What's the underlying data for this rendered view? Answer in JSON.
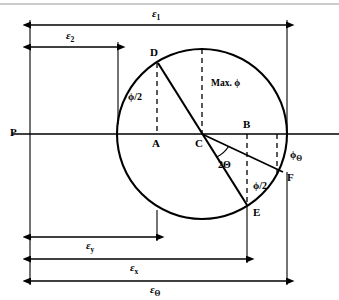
{
  "figure": {
    "colors": {
      "stroke": "#000000",
      "background": "#ffffff",
      "rule": "#888888"
    },
    "points": [
      {
        "id": "P",
        "label": "P",
        "x": 30,
        "y": 134,
        "note": "left terminus of horizontal reference axis"
      },
      {
        "id": "D",
        "label": "D",
        "x": 158,
        "y": 63,
        "note": "upper-left point on circle, end of diameter"
      },
      {
        "id": "A",
        "label": "A",
        "x": 157,
        "y": 134,
        "note": "foot of vertical from D on horizontal axis"
      },
      {
        "id": "C",
        "label": "C",
        "x": 202,
        "y": 134,
        "note": "centre of circle, on horizontal axis"
      },
      {
        "id": "B",
        "label": "B",
        "x": 247,
        "y": 134,
        "note": "point on horizontal axis above E"
      },
      {
        "id": "E",
        "label": "E",
        "x": 247,
        "y": 205,
        "note": "lower-right point on circle, end of diameter"
      },
      {
        "id": "F",
        "label": "F",
        "x": 283,
        "y": 172,
        "note": "point on circle on ray from C"
      }
    ],
    "circle": {
      "cx": 202,
      "cy": 134,
      "r": 85
    },
    "angle_labels": [
      {
        "id": "phi-half-upper",
        "text": "ϕ/2",
        "x": 128,
        "y": 97,
        "note": "angle at D between chord and vertical"
      },
      {
        "id": "max-phi",
        "text": "Max. ϕ",
        "x": 212,
        "y": 83,
        "note": "label on centre vertical dashed line"
      },
      {
        "id": "two-theta",
        "text": "2Θ",
        "x": 221,
        "y": 163,
        "note": "angle at C between CE and CF"
      },
      {
        "id": "phi-half-lower",
        "text": "ϕ/2",
        "x": 255,
        "y": 186,
        "note": "angle at E region"
      },
      {
        "id": "phi-theta",
        "text": "ϕ",
        "sub": "Θ",
        "x": 292,
        "y": 158,
        "note": "angle label outside circle at right"
      }
    ],
    "dimensions": [
      {
        "id": "eps-1",
        "symbol": "ε",
        "sub": "1",
        "y": 25,
        "x1": 30,
        "x2": 287,
        "label_x": 152,
        "label_y": 9,
        "note": "top overall width P to right edge of circle"
      },
      {
        "id": "eps-2",
        "symbol": "ε",
        "sub": "2",
        "y": 47,
        "x1": 30,
        "x2": 118,
        "label_x": 66,
        "label_y": 31,
        "note": "P to left edge of circle"
      },
      {
        "id": "eps-y",
        "symbol": "ε",
        "sub": "y",
        "y": 237,
        "x1": 30,
        "x2": 157,
        "label_x": 86,
        "label_y": 243,
        "note": "P to vertical through A"
      },
      {
        "id": "eps-x",
        "symbol": "ε",
        "sub": "x",
        "y": 259,
        "x1": 30,
        "x2": 247,
        "label_x": 130,
        "label_y": 265,
        "note": "P to vertical through E/B"
      },
      {
        "id": "eps-theta",
        "symbol": "ε",
        "sub": "Θ",
        "y": 281,
        "x1": 30,
        "x2": 287,
        "label_x": 150,
        "label_y": 287,
        "note": "P to vertical through F, overall"
      }
    ],
    "axis": {
      "y": 134,
      "x1": 12,
      "x2": 339,
      "label": "P"
    },
    "dashed_verticals": [
      {
        "id": "vert-A",
        "x": 157,
        "y1": 63,
        "y2": 134,
        "note": "from D down to A"
      },
      {
        "id": "vert-C",
        "x": 202,
        "y1": 49,
        "y2": 134,
        "note": "centre vertical, top of circle to C"
      },
      {
        "id": "vert-B",
        "x": 247,
        "y1": 134,
        "y2": 205,
        "note": "from B down to E"
      },
      {
        "id": "vert-F",
        "x": 277,
        "y1": 134,
        "y2": 172,
        "note": "from axis down to F level"
      }
    ],
    "top_rule": {
      "y": 4,
      "x1": 0,
      "x2": 339
    }
  }
}
